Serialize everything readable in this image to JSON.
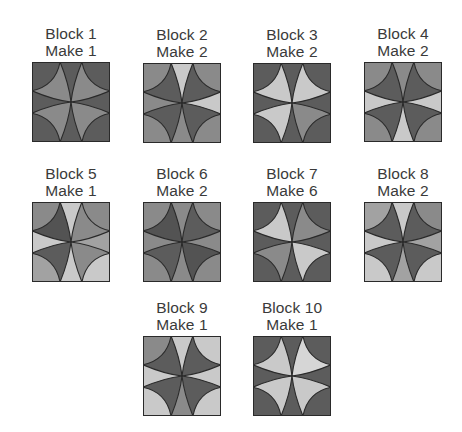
{
  "palette": {
    "dark": "#5c5c5c",
    "darker": "#535353",
    "medium": "#8a8a8a",
    "medlight": "#a2a2a2",
    "light": "#c9c9c9",
    "lighter": "#d6d6d6",
    "outline": "#2a2a2a",
    "text": "#3a3a3a"
  },
  "blocks": [
    {
      "title": "Block 1",
      "make": "Make 1",
      "x": 26,
      "y": 25,
      "corners": [
        "dark",
        "dark",
        "dark",
        "dark"
      ],
      "spikes": [
        "dark",
        "dark",
        "dark",
        "dark"
      ],
      "petals": [
        "medium",
        "medium",
        "medium",
        "medium"
      ]
    },
    {
      "title": "Block 2",
      "make": "Make 2",
      "x": 137,
      "y": 26,
      "corners": [
        "medium",
        "medium",
        "medium",
        "medium"
      ],
      "spikes": [
        "light",
        "light",
        "medium",
        "medium"
      ],
      "petals": [
        "dark",
        "dark",
        "dark",
        "dark"
      ]
    },
    {
      "title": "Block 3",
      "make": "Make 2",
      "x": 247,
      "y": 26,
      "corners": [
        "dark",
        "dark",
        "dark",
        "dark"
      ],
      "spikes": [
        "dark",
        "dark",
        "dark",
        "dark"
      ],
      "petals": [
        "light",
        "light",
        "light",
        "medium"
      ]
    },
    {
      "title": "Block 4",
      "make": "Make 2",
      "x": 358,
      "y": 25,
      "corners": [
        "medium",
        "medium",
        "medium",
        "medium"
      ],
      "spikes": [
        "medium",
        "light",
        "light",
        "light"
      ],
      "petals": [
        "dark",
        "dark",
        "dark",
        "dark"
      ]
    },
    {
      "title": "Block 5",
      "make": "Make 1",
      "x": 26,
      "y": 165,
      "corners": [
        "medium",
        "medium",
        "medlight",
        "light"
      ],
      "spikes": [
        "light",
        "medlight",
        "light",
        "light"
      ],
      "petals": [
        "darker",
        "medium",
        "dark",
        "medium"
      ]
    },
    {
      "title": "Block 6",
      "make": "Make 2",
      "x": 137,
      "y": 165,
      "corners": [
        "medium",
        "medium",
        "medium",
        "medium"
      ],
      "spikes": [
        "medium",
        "medium",
        "medium",
        "medium"
      ],
      "petals": [
        "darker",
        "dark",
        "dark",
        "darker"
      ]
    },
    {
      "title": "Block 7",
      "make": "Make 6",
      "x": 247,
      "y": 165,
      "corners": [
        "dark",
        "dark",
        "dark",
        "dark"
      ],
      "spikes": [
        "dark",
        "dark",
        "dark",
        "dark"
      ],
      "petals": [
        "light",
        "medium",
        "medium",
        "light"
      ]
    },
    {
      "title": "Block 8",
      "make": "Make 2",
      "x": 358,
      "y": 165,
      "corners": [
        "medlight",
        "medium",
        "light",
        "light"
      ],
      "spikes": [
        "light",
        "medlight",
        "medlight",
        "light"
      ],
      "petals": [
        "dark",
        "dark",
        "dark",
        "dark"
      ]
    },
    {
      "title": "Block 9",
      "make": "Make 1",
      "x": 137,
      "y": 299,
      "corners": [
        "medium",
        "light",
        "light",
        "light"
      ],
      "spikes": [
        "light",
        "light",
        "medium",
        "light"
      ],
      "petals": [
        "dark",
        "dark",
        "dark",
        "dark"
      ]
    },
    {
      "title": "Block 10",
      "make": "Make 1",
      "x": 247,
      "y": 299,
      "corners": [
        "dark",
        "dark",
        "dark",
        "dark"
      ],
      "spikes": [
        "dark",
        "dark",
        "dark",
        "dark"
      ],
      "petals": [
        "light",
        "lighter",
        "light",
        "light"
      ]
    }
  ]
}
